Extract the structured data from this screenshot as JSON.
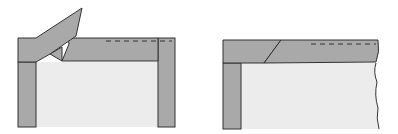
{
  "diagram": {
    "type": "woodworking-frame-joint-illustration",
    "figures": [
      {
        "id": "left",
        "description": "Frame corner with angled piece lifted off top rail, two posts"
      },
      {
        "id": "right",
        "description": "Assembled frame corner with scarf joint in top rail, torn edge on right"
      }
    ],
    "colors": {
      "wood": "#a9a9a9",
      "panel": "#ececec",
      "outline": "#333333",
      "background": "#ffffff"
    }
  }
}
